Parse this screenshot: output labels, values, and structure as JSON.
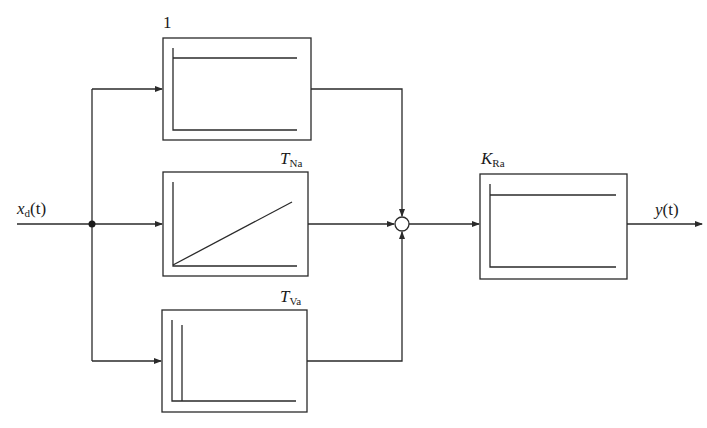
{
  "diagram": {
    "type": "block-diagram",
    "input": {
      "symbol": "x",
      "subscript": "d",
      "arg": "(t)"
    },
    "output": {
      "symbol": "y",
      "arg": "(t)"
    },
    "blocks": [
      {
        "id": "p-block",
        "label_main": "1",
        "label_sub": "",
        "response": "step"
      },
      {
        "id": "i-block",
        "label_main": "T",
        "label_sub": "Na",
        "response": "ramp"
      },
      {
        "id": "d-block",
        "label_main": "T",
        "label_sub": "Va",
        "response": "impulse"
      },
      {
        "id": "gain-block",
        "label_main": "K",
        "label_sub": "Ra",
        "response": "step"
      }
    ],
    "summing_junction": {
      "inputs": 3
    },
    "colors": {
      "line": "#2a2a2a",
      "background": "#ffffff"
    }
  }
}
